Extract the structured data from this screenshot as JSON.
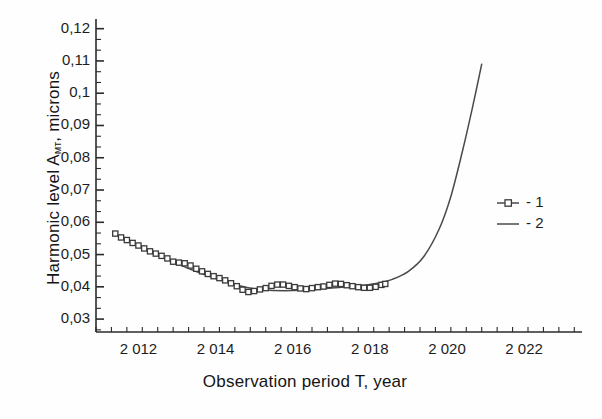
{
  "chart_data": {
    "type": "line",
    "title": "",
    "xlabel": "Observation period T, year",
    "ylabel": "Harmonic level A",
    "ylabel_sub": "мт",
    "ylabel_units": ", microns",
    "xlim": [
      2010.9,
      2023.5
    ],
    "ylim": [
      0.026,
      0.123
    ],
    "grid": false,
    "legend_position": "right",
    "y_ticks": [
      "0,12",
      "0,11",
      "0,1",
      "0,09",
      "0,08",
      "0,07",
      "0,06",
      "0,05",
      "0,04",
      "0,03"
    ],
    "y_tick_values": [
      0.12,
      0.11,
      0.1,
      0.09,
      0.08,
      0.07,
      0.06,
      0.05,
      0.04,
      0.03
    ],
    "y_minor_per_major": 2,
    "x_ticks": [
      "2 012",
      "2 014",
      "2 016",
      "2 018",
      "2 020",
      "2 022"
    ],
    "x_tick_values": [
      2012,
      2014,
      2016,
      2018,
      2020,
      2022
    ],
    "x_minor_per_major": 4,
    "legend": [
      {
        "label": "- 1",
        "marker": "square",
        "style": "line-with-markers"
      },
      {
        "label": "- 2",
        "marker": "none",
        "style": "line"
      }
    ],
    "series": [
      {
        "name": "- 1",
        "marker": "square",
        "color": "#3a3a3a",
        "x": [
          2011.4,
          2011.55,
          2011.7,
          2011.85,
          2012.0,
          2012.15,
          2012.3,
          2012.45,
          2012.6,
          2012.75,
          2012.9,
          2013.05,
          2013.2,
          2013.35,
          2013.5,
          2013.65,
          2013.8,
          2013.95,
          2014.1,
          2014.25,
          2014.4,
          2014.55,
          2014.7,
          2014.85,
          2015.0,
          2015.15,
          2015.3,
          2015.45,
          2015.6,
          2015.75,
          2015.9,
          2016.05,
          2016.2,
          2016.35,
          2016.5,
          2016.65,
          2016.8,
          2016.95,
          2017.1,
          2017.25,
          2017.4,
          2017.55,
          2017.7,
          2017.85,
          2018.0,
          2018.15,
          2018.3,
          2018.4
        ],
        "y": [
          0.0565,
          0.0553,
          0.0545,
          0.0536,
          0.0528,
          0.0519,
          0.051,
          0.0503,
          0.0496,
          0.0488,
          0.0478,
          0.0475,
          0.0473,
          0.0466,
          0.0456,
          0.0448,
          0.044,
          0.0433,
          0.0427,
          0.042,
          0.0411,
          0.0402,
          0.0391,
          0.0384,
          0.0387,
          0.0392,
          0.0396,
          0.0403,
          0.0407,
          0.0407,
          0.0403,
          0.0399,
          0.0395,
          0.0393,
          0.0396,
          0.0399,
          0.0401,
          0.0406,
          0.041,
          0.0409,
          0.0405,
          0.0402,
          0.0399,
          0.0397,
          0.0397,
          0.04,
          0.0406,
          0.0409
        ]
      },
      {
        "name": "- 2",
        "marker": "none",
        "color": "#4a4a4a",
        "x": [
          2011.4,
          2011.8,
          2012.2,
          2012.6,
          2013.0,
          2013.4,
          2013.8,
          2014.2,
          2014.6,
          2015.0,
          2015.4,
          2015.8,
          2016.2,
          2016.6,
          2017.0,
          2017.4,
          2017.8,
          2018.2,
          2018.6,
          2019.0,
          2019.4,
          2019.8,
          2020.1,
          2020.4,
          2020.65,
          2020.9
        ],
        "y": [
          0.0563,
          0.0538,
          0.0515,
          0.0493,
          0.0472,
          0.0452,
          0.0434,
          0.0418,
          0.0404,
          0.0394,
          0.0389,
          0.0388,
          0.0389,
          0.0392,
          0.0396,
          0.04,
          0.0404,
          0.0411,
          0.0424,
          0.0448,
          0.0494,
          0.058,
          0.068,
          0.082,
          0.095,
          0.109
        ]
      }
    ]
  }
}
